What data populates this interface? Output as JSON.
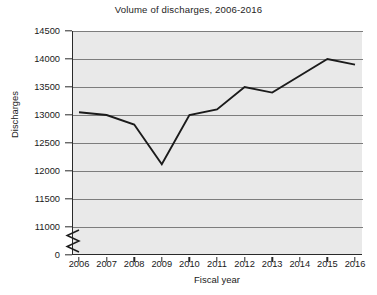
{
  "chart_data": {
    "type": "line",
    "title": "Volume of discharges, 2006-2016",
    "xlabel": "Fiscal year",
    "ylabel": "Discharges",
    "categories": [
      "2006",
      "2007",
      "2008",
      "2009",
      "2010",
      "2011",
      "2012",
      "2013",
      "2014",
      "2015",
      "2016"
    ],
    "values": [
      13050,
      13000,
      12830,
      12120,
      13000,
      13100,
      13500,
      13400,
      13700,
      14000,
      13900
    ],
    "series": [
      {
        "name": "Discharges",
        "values": [
          13050,
          13000,
          12830,
          12120,
          13000,
          13100,
          13500,
          13400,
          13700,
          14000,
          13900
        ]
      }
    ],
    "x_tick_labels": [
      "2006",
      "2007",
      "2008",
      "2009",
      "2010",
      "2011",
      "2012",
      "2013",
      "2014",
      "2015",
      "2016"
    ],
    "y_tick_labels": [
      "14500",
      "14000",
      "13500",
      "13000",
      "12500",
      "12000",
      "11500",
      "11000",
      "0"
    ],
    "y_tick_values": [
      14500,
      14000,
      13500,
      13000,
      12500,
      12000,
      11500,
      11000,
      0
    ],
    "ylim": [
      11000,
      14500
    ],
    "xlim": [
      "2006",
      "2016"
    ],
    "axis_break": true,
    "axis_break_note": "y-axis broken between 0 and 11000",
    "grid": true,
    "grid_axis": "y",
    "legend": false,
    "legend_position": "none",
    "plot_background_color": "#e9e9e9",
    "gridline_color": "#7d7d7d",
    "line_color": "#1b1b1b",
    "axis_color": "#2a2a2a",
    "figure_background_color": "#ffffff"
  },
  "axes": {
    "y_title": "Discharges",
    "x_title": "Fiscal year"
  }
}
